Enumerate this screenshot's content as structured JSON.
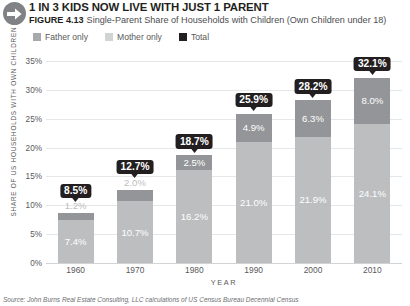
{
  "header": {
    "badge_icon": "right-arrow-icon",
    "headline": "1 IN 3 KIDS NOW LIVE WITH JUST 1 PARENT",
    "figure_number": "FIGURE 4.13",
    "caption": "Single-Parent Share of Households with Children (Own Children under 18)"
  },
  "legend": [
    {
      "label": "Father only",
      "color": "#939598"
    },
    {
      "label": "Mother only",
      "color": "#bcbec0"
    },
    {
      "label": "Total",
      "color": "#231f20"
    }
  ],
  "source": "Source: John Burns Real Estate Consulting, LLC calculations of US Census Bureau Decennial Census",
  "chart_data": {
    "type": "bar",
    "title": "Single-Parent Share of Households with Children (Own Children under 18)",
    "xlabel": "YEAR",
    "ylabel": "SHARE OF US HOUSEHOLDS WITH OWN CHILDREN",
    "categories": [
      "1960",
      "1970",
      "1980",
      "1990",
      "2000",
      "2010"
    ],
    "ylim": [
      0,
      35
    ],
    "ytick_labels": [
      "0%",
      "5%",
      "10%",
      "15%",
      "20%",
      "25%",
      "30%",
      "35%"
    ],
    "ytick_values": [
      0,
      5,
      10,
      15,
      20,
      25,
      30,
      35
    ],
    "grid": true,
    "stacked": true,
    "legend_position": "top-left",
    "series": [
      {
        "name": "Mother only",
        "color": "#bcbec0",
        "values": [
          7.4,
          10.7,
          16.2,
          21.0,
          21.9,
          24.1
        ],
        "labels": [
          "7.4%",
          "10.7%",
          "16.2%",
          "21.0%",
          "21.9%",
          "24.1%"
        ]
      },
      {
        "name": "Father only",
        "color": "#939598",
        "values": [
          1.2,
          2.0,
          2.5,
          4.9,
          6.3,
          8.0
        ],
        "labels": [
          "1.2%",
          "2.0%",
          "2.5%",
          "4.9%",
          "6.3%",
          "8.0%"
        ]
      }
    ],
    "totals": {
      "name": "Total",
      "color": "#231f20",
      "values": [
        8.5,
        12.7,
        18.7,
        25.9,
        28.2,
        32.1
      ],
      "labels": [
        "8.5%",
        "12.7%",
        "18.7%",
        "25.9%",
        "28.2%",
        "32.1%"
      ]
    }
  }
}
